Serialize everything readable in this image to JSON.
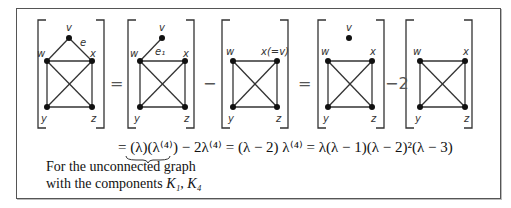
{
  "graphs": [
    {
      "id": "G",
      "labels": {
        "v": "v",
        "w": "w",
        "x": "x",
        "y": "y",
        "z": "z",
        "edge": "e"
      }
    },
    {
      "id": "G_minus_e1",
      "labels": {
        "v": "v",
        "w": "w",
        "x": "x",
        "y": "y",
        "z": "z",
        "edge": "e₁"
      }
    },
    {
      "id": "K4_merged",
      "labels": {
        "w": "w",
        "x": "x(=v)",
        "y": "y",
        "z": "z"
      }
    },
    {
      "id": "K1_plus_K4",
      "labels": {
        "v": "v",
        "w": "w",
        "x": "x",
        "y": "y",
        "z": "z"
      }
    },
    {
      "id": "K4",
      "labels": {
        "w": "w",
        "x": "x",
        "y": "y",
        "z": "z"
      }
    }
  ],
  "operators": [
    "=",
    "−",
    "=",
    "−2"
  ],
  "equation": "= (λ)(λ⁽⁴⁾) − 2λ⁽⁴⁾ = (λ − 2) λ⁽⁴⁾ = λ(λ − 1)(λ − 2)²(λ − 3)",
  "annotation": {
    "line1": "For the unconnected graph",
    "line2_prefix": "with the components ",
    "line2_math": "K₁, K₄"
  }
}
